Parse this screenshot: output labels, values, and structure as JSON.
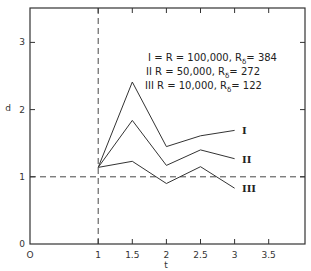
{
  "chart_data": {
    "type": "line",
    "title": "",
    "xlabel": "t",
    "ylabel": "d",
    "xlim": [
      0,
      4
    ],
    "ylim": [
      0,
      3.5
    ],
    "x_ticks": [
      "0",
      "1",
      "1.5",
      "2",
      "2.5",
      "3",
      "3.5"
    ],
    "y_ticks": [
      "0",
      "1",
      "2",
      "3"
    ],
    "x": [
      1,
      1.5,
      2,
      2.5,
      3
    ],
    "series": [
      {
        "name": "I",
        "label": "I",
        "values": [
          1.14,
          2.41,
          1.45,
          1.61,
          1.69
        ]
      },
      {
        "name": "II",
        "label": "II",
        "values": [
          1.14,
          1.84,
          1.17,
          1.4,
          1.27
        ]
      },
      {
        "name": "III",
        "label": "III",
        "values": [
          1.14,
          1.23,
          0.9,
          1.15,
          0.83
        ]
      }
    ],
    "legend": [
      {
        "label": "I = R = 100,000, R",
        "sub": "δ",
        "value": "= 384"
      },
      {
        "label": "II  R = 50,000, R",
        "sub": "δ",
        "value": "= 272"
      },
      {
        "label": "III  R = 10,000, R",
        "sub": "δ",
        "value": "= 122"
      }
    ],
    "reference_lines": [
      {
        "orientation": "horizontal",
        "value": 1,
        "style": "dashed"
      },
      {
        "orientation": "vertical",
        "value": 1,
        "style": "dashed"
      }
    ],
    "grid": false,
    "legend_position": "upper-center"
  }
}
